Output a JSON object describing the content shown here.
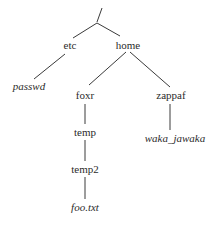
{
  "diagram": {
    "type": "directory-tree",
    "nodes": {
      "root": {
        "label": "/",
        "kind": "directory"
      },
      "etc": {
        "label": "etc",
        "kind": "directory"
      },
      "home": {
        "label": "home",
        "kind": "directory"
      },
      "passwd": {
        "label": "passwd",
        "kind": "file"
      },
      "foxr": {
        "label": "foxr",
        "kind": "directory"
      },
      "zappaf": {
        "label": "zappaf",
        "kind": "directory"
      },
      "temp": {
        "label": "temp",
        "kind": "directory"
      },
      "temp2": {
        "label": "temp2",
        "kind": "directory"
      },
      "foo_txt": {
        "label": "foo.txt",
        "kind": "file"
      },
      "waka_jawaka": {
        "label": "waka_jawaka",
        "kind": "file"
      }
    },
    "edges": [
      [
        "root",
        "etc"
      ],
      [
        "root",
        "home"
      ],
      [
        "etc",
        "passwd"
      ],
      [
        "home",
        "foxr"
      ],
      [
        "home",
        "zappaf"
      ],
      [
        "foxr",
        "temp"
      ],
      [
        "temp",
        "temp2"
      ],
      [
        "temp2",
        "foo_txt"
      ],
      [
        "zappaf",
        "waka_jawaka"
      ]
    ]
  }
}
